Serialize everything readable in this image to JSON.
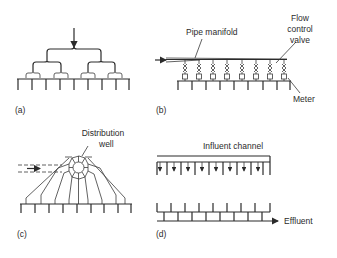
{
  "panels": [
    {
      "id": "a",
      "label": "(a)",
      "description": "Hierarchical branching splitter"
    },
    {
      "id": "b",
      "label": "(b)",
      "description": "Pipe manifold with flow control valves and meters",
      "annotations": [
        "Pipe manifold",
        "Flow\ncontrol\nvalve",
        "Meter"
      ]
    },
    {
      "id": "c",
      "label": "(c)",
      "description": "Distribution well",
      "annotations": [
        "Distribution\nwell"
      ]
    },
    {
      "id": "d",
      "label": "(d)",
      "description": "Influent channel and effluent",
      "annotations": [
        "Influent channel",
        "Effluent"
      ]
    }
  ],
  "labels": {
    "a": "(a)",
    "b": "(b)",
    "c": "(c)",
    "d": "(d)",
    "pipe_manifold": "Pipe manifold",
    "flow_line1": "Flow",
    "flow_line2": "control",
    "flow_line3": "valve",
    "meter": "Meter",
    "dist_line1": "Distribution",
    "dist_line2": "well",
    "influent_channel": "Influent channel",
    "effluent": "Effluent"
  }
}
